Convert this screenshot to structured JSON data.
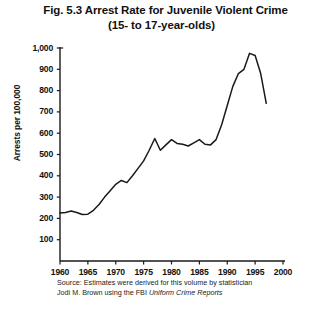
{
  "title": {
    "line1": "Fig. 5.3  Arrest Rate for Juvenile Violent Crime",
    "line2": "(15- to 17-year-olds)"
  },
  "source": {
    "line1": "Source: Estimates were derived for this volume by statistician",
    "line2_prefix": "Jodi M. Brown using the FBI ",
    "line2_italic": "Uniform Crime Reports"
  },
  "chart_data": {
    "type": "line",
    "title": "Fig. 5.3  Arrest Rate for Juvenile Violent Crime (15- to 17-year-olds)",
    "xlabel": "",
    "ylabel": "Arrests per 100,000",
    "xlim": [
      1960,
      2000
    ],
    "ylim": [
      0,
      1000
    ],
    "xticks": [
      1960,
      1965,
      1970,
      1975,
      1980,
      1985,
      1990,
      1995,
      2000
    ],
    "yticks": [
      100,
      200,
      300,
      400,
      500,
      600,
      700,
      800,
      900,
      1000
    ],
    "ytick_labels": [
      "100",
      "200",
      "300",
      "400",
      "500",
      "600",
      "700",
      "800",
      "900",
      "1,000"
    ],
    "xtick_labels": [
      "1960",
      "1965",
      "1970",
      "1975",
      "1980",
      "1985",
      "1990",
      "1995",
      "2000"
    ],
    "grid": false,
    "legend": false,
    "line_color": "#1a1a1a",
    "x": [
      1960,
      1961,
      1962,
      1963,
      1964,
      1965,
      1966,
      1967,
      1968,
      1969,
      1970,
      1971,
      1972,
      1973,
      1974,
      1975,
      1976,
      1977,
      1978,
      1979,
      1980,
      1981,
      1982,
      1983,
      1984,
      1985,
      1986,
      1987,
      1988,
      1989,
      1990,
      1991,
      1992,
      1993,
      1994,
      1995,
      1996,
      1997
    ],
    "y": [
      225,
      228,
      235,
      228,
      218,
      220,
      238,
      265,
      300,
      330,
      360,
      378,
      368,
      400,
      435,
      470,
      520,
      575,
      520,
      545,
      570,
      552,
      548,
      540,
      555,
      570,
      548,
      545,
      570,
      640,
      730,
      820,
      880,
      900,
      975,
      965,
      880,
      740
    ],
    "series": [
      {
        "name": "Juvenile violent crime arrest rate",
        "values": [
          225,
          228,
          235,
          228,
          218,
          220,
          238,
          265,
          300,
          330,
          360,
          378,
          368,
          400,
          435,
          470,
          520,
          575,
          520,
          545,
          570,
          552,
          548,
          540,
          555,
          570,
          548,
          545,
          570,
          640,
          730,
          820,
          880,
          900,
          975,
          965,
          880,
          740
        ]
      }
    ],
    "annotations": {
      "peak_year": 1994,
      "peak_value": 975,
      "start_value": 225,
      "end_year": 1997,
      "end_value": 740
    }
  }
}
